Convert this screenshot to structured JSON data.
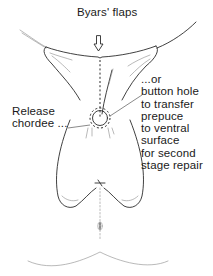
{
  "figure": {
    "type": "surgical-illustration",
    "labels": {
      "top": "Byars' flaps",
      "left": "Release\nchordee ...",
      "right": "...or\nbutton hole\nto transfer\nprepuce\nto ventral\nsurface\nfor second\nstage repair"
    },
    "colors": {
      "ink": "#2b2b2b",
      "background": "#ffffff"
    }
  }
}
